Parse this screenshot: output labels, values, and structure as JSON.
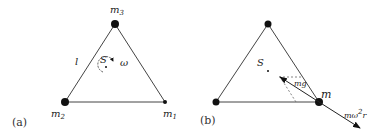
{
  "panel_a": {
    "caption": "(a)",
    "labels": {
      "top_mass": "m",
      "top_mass_sub": "3",
      "left_mass": "m",
      "left_mass_sub": "2",
      "right_mass": "m",
      "right_mass_sub": "1",
      "side_length": "l",
      "center": "S",
      "angular_velocity": "ω"
    }
  },
  "panel_b": {
    "caption": "(b)",
    "labels": {
      "center": "S",
      "mass": "m",
      "gravity_force": "mg",
      "centrifugal_force": "mω",
      "centrifugal_exp": "2",
      "centrifugal_r": "r"
    }
  },
  "colors": {
    "line": "#444444",
    "mass": "#111111",
    "text": "#222222"
  }
}
